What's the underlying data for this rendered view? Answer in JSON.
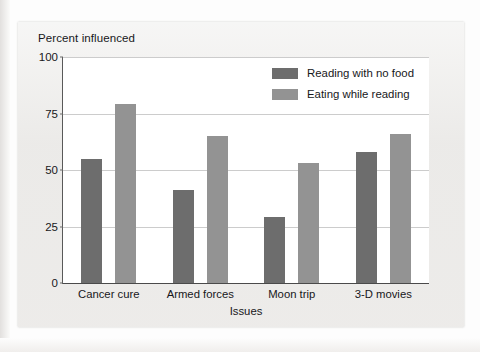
{
  "chart_data": {
    "type": "bar",
    "title": "",
    "categories": [
      "Cancer cure",
      "Armed forces",
      "Moon trip",
      "3-D movies"
    ],
    "series": [
      {
        "name": "Reading with no food",
        "color": "#6d6d6d",
        "values": [
          55,
          41,
          29,
          58
        ]
      },
      {
        "name": "Eating while reading",
        "color": "#939393",
        "values": [
          79,
          65,
          53,
          66
        ]
      }
    ],
    "xlabel": "Issues",
    "ylabel": "Percent influenced",
    "ylim": [
      0,
      100
    ],
    "yticks": [
      0,
      25,
      50,
      75,
      100
    ],
    "ytick_labels": [
      "0",
      "25",
      "50",
      "75",
      "100"
    ],
    "grid": "horizontal",
    "legend_position": "top-right-inside"
  },
  "figure": {
    "panel_background": "#ecebe9",
    "plot_background": "#ffffff",
    "gridline_color": "#cccccc",
    "axis_color": "#4a4a4a"
  }
}
